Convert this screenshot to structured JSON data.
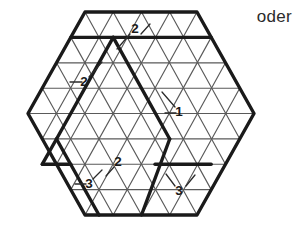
{
  "figure": {
    "type": "hexagonal-triangular-grid",
    "caption_text": "oder",
    "background_color": "#ffffff",
    "grid_line_color": "#5a5a5a",
    "bold_line_color": "#1a1a1a",
    "label_color": "#1a1a1a",
    "hexagon": {
      "center_x": 141,
      "center_y": 113.5,
      "radius_x": 113,
      "radius_y": 101.5,
      "rows_per_side": 4,
      "cell_width": 28.25,
      "row_height": 25.4
    },
    "labels": [
      {
        "id": "label-top-2",
        "text": "2",
        "x": 135,
        "y": 29,
        "leader": [
          [
            130,
            34
          ],
          [
            117,
            49
          ]
        ]
      },
      {
        "id": "label-left-2",
        "text": "2",
        "x": 84,
        "y": 82,
        "leader": [
          [
            89,
            77
          ],
          [
            102,
            62
          ]
        ]
      },
      {
        "id": "label-center-1",
        "text": "1",
        "x": 179,
        "y": 112,
        "leader": [
          [
            175,
            107
          ],
          [
            162,
            92
          ]
        ]
      },
      {
        "id": "label-bottom-left-2",
        "text": "2",
        "x": 118,
        "y": 162,
        "leader": [
          [
            114,
            167
          ],
          [
            106,
            176
          ]
        ]
      },
      {
        "id": "label-bottom-left-3",
        "text": "3",
        "x": 89,
        "y": 184,
        "leader": [
          [
            93,
            179
          ],
          [
            102,
            170
          ]
        ]
      },
      {
        "id": "label-bottom-right-3",
        "text": "3",
        "x": 179,
        "y": 191,
        "leader": [
          [
            175,
            186
          ],
          [
            166,
            174
          ]
        ]
      }
    ],
    "label_tick_marks": [
      {
        "id": "tick-top-2",
        "from": [
          141,
          34
        ],
        "to": [
          150,
          24
        ]
      },
      {
        "id": "tick-left-2",
        "from": [
          70,
          82
        ],
        "to": [
          82,
          82
        ]
      },
      {
        "id": "tick-center-1",
        "from": [
          165,
          113
        ],
        "to": [
          176,
          113
        ]
      },
      {
        "id": "tick-bottom-3",
        "from": [
          75,
          184
        ],
        "to": [
          86,
          184
        ]
      },
      {
        "id": "tick-bottomright-3",
        "from": [
          186,
          186
        ],
        "to": [
          195,
          175
        ]
      }
    ]
  },
  "chart_data": {
    "type": "diagram",
    "title": "",
    "annotation_values": [
      2,
      2,
      1,
      2,
      3,
      3
    ],
    "alternative_marker": "oder"
  }
}
